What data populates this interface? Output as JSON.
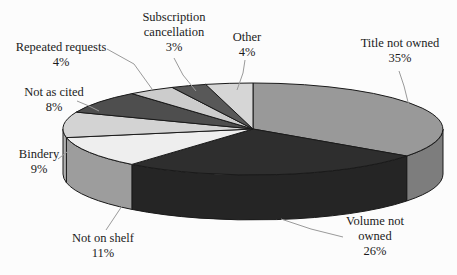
{
  "figure": {
    "background": "#fcfcfc",
    "text_color": "#1b1b1b",
    "outline_color": "#1a1a1a",
    "leader_line_color": "#9a9a9a"
  },
  "chart_data": {
    "type": "pie",
    "style": "3d",
    "title": "",
    "legend_position": "none",
    "start_angle_deg": 0,
    "direction": "clockwise",
    "data_labels": "category-name-and-percentage",
    "segments": [
      {
        "label": "Title not owned",
        "value_pct": 35,
        "value_label": "35%",
        "top_color": "#999999",
        "side_color": "#7d7d7d"
      },
      {
        "label": "Volume not owned",
        "value_pct": 26,
        "value_label": "26%",
        "top_color": "#2e2e2e",
        "side_color": "#252525"
      },
      {
        "label": "Not on shelf",
        "value_pct": 11,
        "value_label": "11%",
        "top_color": "#eeeeee",
        "side_color": "#9d9d9d"
      },
      {
        "label": "Bindery",
        "value_pct": 9,
        "value_label": "9%",
        "top_color": "#d3d3d3",
        "side_color": "#b1b1b1"
      },
      {
        "label": "Not as cited",
        "value_pct": 8,
        "value_label": "8%",
        "top_color": "#4e4e4e",
        "side_color": "#3f3f3f"
      },
      {
        "label": "Repeated requests",
        "value_pct": 4,
        "value_label": "4%",
        "top_color": "#cccccc",
        "side_color": "#ababab"
      },
      {
        "label": "Subscription cancellation",
        "value_pct": 3,
        "value_label": "3%",
        "top_color": "#585858",
        "side_color": "#474747"
      },
      {
        "label": "Other",
        "value_pct": 4,
        "value_label": "4%",
        "top_color": "#d6d6d6",
        "side_color": "#b5b5b5"
      }
    ]
  }
}
